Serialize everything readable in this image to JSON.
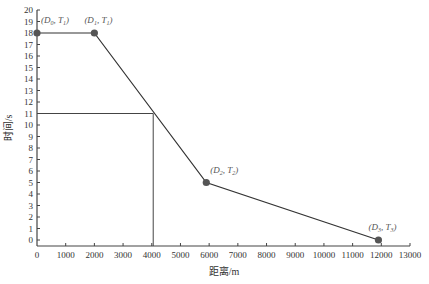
{
  "chart_data": {
    "type": "line",
    "title": "",
    "xlabel": "距离/m",
    "ylabel": "时间/s",
    "xlim": [
      0,
      13000
    ],
    "ylim": [
      0,
      20
    ],
    "x_ticks": [
      0,
      1000,
      2000,
      3000,
      4000,
      5000,
      6000,
      7000,
      8000,
      9000,
      10000,
      11000,
      12000,
      13000
    ],
    "y_ticks": [
      0,
      1,
      2,
      3,
      4,
      5,
      6,
      7,
      8,
      9,
      10,
      11,
      12,
      13,
      14,
      15,
      16,
      17,
      18,
      19,
      20
    ],
    "grid": false,
    "series": [
      {
        "name": "时间-距离曲线",
        "x": [
          0,
          2000,
          5900,
          11900
        ],
        "y": [
          18,
          18,
          5,
          0
        ]
      }
    ],
    "points": [
      {
        "label": "(D0, T1)",
        "x": 0,
        "y": 18
      },
      {
        "label": "(D1, T1)",
        "x": 2000,
        "y": 18
      },
      {
        "label": "(D2, T2)",
        "x": 5900,
        "y": 5
      },
      {
        "label": "(D3, T3)",
        "x": 11900,
        "y": 0
      }
    ],
    "annotations": [
      {
        "type": "hline",
        "y": 11,
        "x_from": 0,
        "x_to": 4050
      },
      {
        "type": "vline",
        "x": 4050,
        "y_from": 0,
        "y_to": 11
      }
    ]
  },
  "labels": {
    "xlabel": "距离/m",
    "ylabel": "时间/s",
    "p0_main": "(D",
    "p0_sub": "0",
    "p0_mid": ", T",
    "p0_sub2": "1",
    "p1_sub": "1",
    "p1_sub2": "1",
    "p2_sub": "2",
    "p2_sub2": "2",
    "p3_sub": "3",
    "p3_sub2": "3"
  }
}
